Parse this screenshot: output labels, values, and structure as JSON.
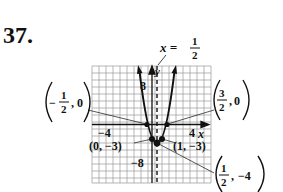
{
  "problem": {
    "number": "37."
  },
  "graph": {
    "function": "y = 4x^2 - 4x - 3",
    "axis_of_symmetry": {
      "label_lhs": "x =",
      "num": "1",
      "den": "2"
    },
    "axis_labels": {
      "x": "x",
      "y": "y"
    },
    "ticks": {
      "x_neg": "−4",
      "x_pos": "4",
      "y_pos": "8",
      "y_neg": "−8"
    },
    "points": [
      {
        "label": "(0, −3)",
        "x": 0,
        "y": -3
      },
      {
        "label": "(1, −3)",
        "x": 1,
        "y": -3
      }
    ],
    "fraction_points": [
      {
        "name": "left-x-intercept",
        "sign": "−",
        "num": "1",
        "den": "2",
        "y": "0",
        "x": -0.5,
        "yv": 0
      },
      {
        "name": "right-x-intercept",
        "sign": "",
        "num": "3",
        "den": "2",
        "y": "0",
        "x": 1.5,
        "yv": 0
      },
      {
        "name": "vertex",
        "sign": "",
        "num": "1",
        "den": "2",
        "y": "−4",
        "x": 0.5,
        "yv": -4
      }
    ],
    "colors": {
      "ink": "#111111",
      "grid": "#9a9a9a"
    }
  }
}
